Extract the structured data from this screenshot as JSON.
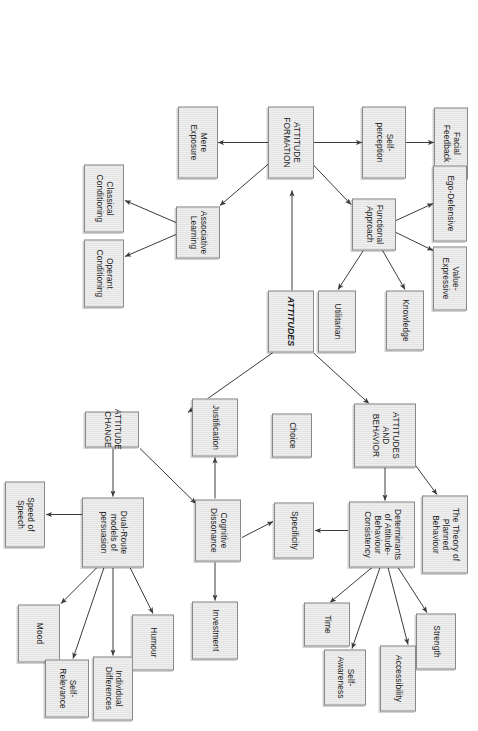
{
  "figure": {
    "orientation": "rotated-90-clockwise",
    "box_fill": "#e3e3e3",
    "box_border": "#8a8a8a",
    "arrow_color": "#3c3c3c",
    "page_background": "#ffffff"
  },
  "nodes": {
    "attitudes": "ATTITUDES",
    "attitude_formation": "ATTITUDE\nFORMATION",
    "attitudes_and_behavior": "ATTITUDES\nAND\nBEHAVIOR",
    "attitude_change": "ATTITUDE\nCHANGE",
    "self_perception": "Self-\nperception",
    "facial_feedback": "Facial\nFeedback",
    "mere_exposure": "Mere\nExposure",
    "associative_learning": "Associative\nLearning",
    "classical_conditioning": "Classical\nConditioning",
    "operant_conditioning": "Operant\nConditioning",
    "functional_approach": "Functional\nApproach",
    "ego_defensive": "Ego-Defensive",
    "value_expressive": "Value-\nExpressive",
    "knowledge": "Knowledge",
    "utilitarian": "Utilitarian",
    "theory_planned_behaviour": "The Theory of\nPlanned\nBehaviour",
    "determinants": "Determinants\nof Attitude-\nBehaviour\nConsistency",
    "strength": "Strength",
    "accessibility": "Accessibility",
    "self_awareness": "Self-\nAwareness",
    "time": "Time",
    "specificity": "Specificity",
    "cognitive_dissonance": "Cognitive\nDissonance",
    "justification": "Justification",
    "investment": "Investment",
    "choice": "Choice",
    "dual_route": "Dual-Route\nmodels of\npersuasion",
    "speed_of_speech": "Speed of\nSpeech",
    "mood": "Mood",
    "humour": "Humour",
    "individual_differences": "Individual\nDifferences",
    "self_relevance": "Self-\nRelevance"
  },
  "edges": [
    {
      "from": "attitudes",
      "to": "attitude_formation"
    },
    {
      "from": "attitudes",
      "to": "attitudes_and_behavior"
    },
    {
      "from": "attitudes",
      "to": "attitude_change"
    },
    {
      "from": "attitude_formation",
      "to": "self_perception"
    },
    {
      "from": "attitude_formation",
      "to": "functional_approach"
    },
    {
      "from": "attitude_formation",
      "to": "mere_exposure"
    },
    {
      "from": "attitude_formation",
      "to": "associative_learning"
    },
    {
      "from": "self_perception",
      "to": "facial_feedback"
    },
    {
      "from": "associative_learning",
      "to": "classical_conditioning"
    },
    {
      "from": "associative_learning",
      "to": "operant_conditioning"
    },
    {
      "from": "functional_approach",
      "to": "ego_defensive"
    },
    {
      "from": "functional_approach",
      "to": "value_expressive"
    },
    {
      "from": "functional_approach",
      "to": "knowledge"
    },
    {
      "from": "functional_approach",
      "to": "utilitarian"
    },
    {
      "from": "attitudes_and_behavior",
      "to": "theory_planned_behaviour"
    },
    {
      "from": "attitudes_and_behavior",
      "to": "determinants"
    },
    {
      "from": "determinants",
      "to": "strength"
    },
    {
      "from": "determinants",
      "to": "accessibility"
    },
    {
      "from": "determinants",
      "to": "self_awareness"
    },
    {
      "from": "determinants",
      "to": "time"
    },
    {
      "from": "determinants",
      "to": "specificity"
    },
    {
      "from": "attitude_change",
      "to": "cognitive_dissonance"
    },
    {
      "from": "attitude_change",
      "to": "dual_route"
    },
    {
      "from": "cognitive_dissonance",
      "to": "justification"
    },
    {
      "from": "cognitive_dissonance",
      "to": "investment"
    },
    {
      "from": "cognitive_dissonance",
      "to": "choice"
    },
    {
      "from": "dual_route",
      "to": "speed_of_speech"
    },
    {
      "from": "dual_route",
      "to": "mood"
    },
    {
      "from": "dual_route",
      "to": "humour"
    },
    {
      "from": "dual_route",
      "to": "individual_differences"
    },
    {
      "from": "dual_route",
      "to": "self_relevance"
    }
  ]
}
